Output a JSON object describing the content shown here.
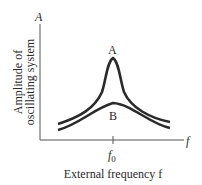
{
  "diagram": {
    "type": "resonance-curves",
    "y_axis": {
      "symbol": "A",
      "label_line1": "Amplitude of",
      "label_line2": "oscillating system"
    },
    "x_axis": {
      "symbol": "f",
      "label": "External frequency f",
      "tick_label_base": "f",
      "tick_label_sub": "0"
    },
    "curves": [
      {
        "name": "A",
        "label": "A",
        "description": "sharp, tall resonance peak at f0 (low damping)"
      },
      {
        "name": "B",
        "label": "B",
        "description": "broad, low resonance peak at f0 (high damping)"
      }
    ],
    "colors": {
      "ink": "#2a2a2a",
      "axis": "#555555",
      "background": "#ffffff"
    }
  }
}
